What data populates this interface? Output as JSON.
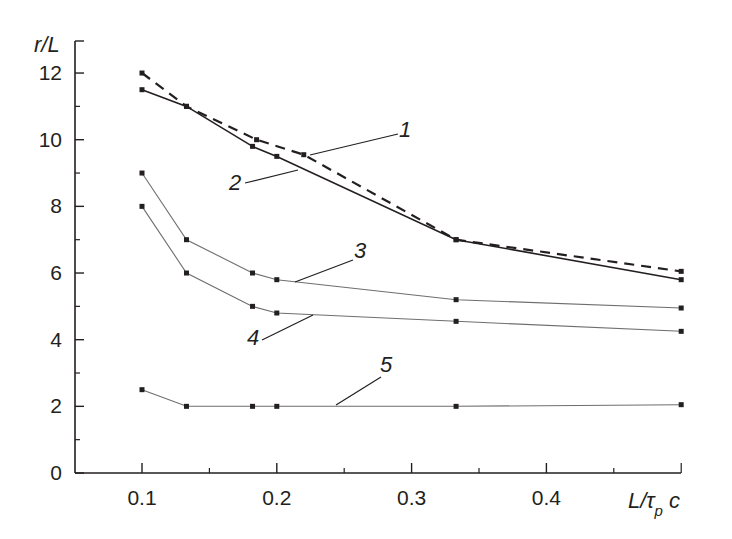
{
  "chart_data": {
    "type": "line",
    "title": "",
    "xlabel": "L/τ_p c",
    "ylabel": "r/L",
    "xlim": [
      0.05,
      0.5
    ],
    "ylim": [
      0,
      13
    ],
    "grid": false,
    "legend": "curve numbers with leader lines",
    "x_ticks": [
      0.1,
      0.2,
      0.3,
      0.4
    ],
    "x_tick_labels": [
      "0.1",
      "0.2",
      "0.3",
      "0.4"
    ],
    "x_minor_ticks": [
      0.15,
      0.25,
      0.35,
      0.45,
      0.5
    ],
    "y_ticks": [
      0,
      2,
      4,
      6,
      8,
      10,
      12
    ],
    "y_tick_labels": [
      "0",
      "2",
      "4",
      "6",
      "8",
      "10",
      "12"
    ],
    "y_minor_ticks": [
      1,
      3,
      5,
      7,
      9,
      11
    ],
    "series": [
      {
        "name": "1",
        "style": "dashed",
        "x": [
          0.1,
          0.133,
          0.185,
          0.22,
          0.333,
          0.5
        ],
        "values": [
          12.0,
          11.0,
          10.0,
          9.55,
          7.0,
          6.05
        ]
      },
      {
        "name": "2",
        "style": "solid-thick",
        "x": [
          0.1,
          0.133,
          0.182,
          0.2,
          0.333,
          0.5
        ],
        "values": [
          11.5,
          11.0,
          9.8,
          9.5,
          7.0,
          5.8
        ]
      },
      {
        "name": "3",
        "style": "solid-thin",
        "x": [
          0.1,
          0.133,
          0.182,
          0.2,
          0.333,
          0.5
        ],
        "values": [
          9.0,
          7.0,
          6.0,
          5.8,
          5.2,
          4.95
        ]
      },
      {
        "name": "4",
        "style": "solid-thin",
        "x": [
          0.1,
          0.133,
          0.182,
          0.2,
          0.333,
          0.5
        ],
        "values": [
          8.0,
          6.0,
          5.0,
          4.8,
          4.55,
          4.25
        ]
      },
      {
        "name": "5",
        "style": "solid-thin",
        "x": [
          0.1,
          0.133,
          0.182,
          0.2,
          0.333,
          0.5
        ],
        "values": [
          2.5,
          2.0,
          2.0,
          2.0,
          2.0,
          2.05
        ]
      }
    ],
    "annotations": [
      {
        "text": "1",
        "label_pos": [
          405,
          137
        ],
        "leader": [
          [
            310,
            155
          ],
          [
            398,
            134
          ]
        ]
      },
      {
        "text": "2",
        "label_pos": [
          235,
          190
        ],
        "leader": [
          [
            245,
            183
          ],
          [
            298,
            170
          ]
        ]
      },
      {
        "text": "3",
        "label_pos": [
          360,
          258
        ],
        "leader": [
          [
            295,
            282
          ],
          [
            353,
            260
          ]
        ]
      },
      {
        "text": "4",
        "label_pos": [
          253,
          345
        ],
        "leader": [
          [
            262,
            340
          ],
          [
            313,
            315
          ]
        ]
      },
      {
        "text": "5",
        "label_pos": [
          386,
          372
        ],
        "leader": [
          [
            336,
            405
          ],
          [
            381,
            377
          ]
        ]
      }
    ]
  },
  "colors": {
    "ink": "#231f20",
    "thin_line": "#6d6e71",
    "background": "#ffffff"
  }
}
